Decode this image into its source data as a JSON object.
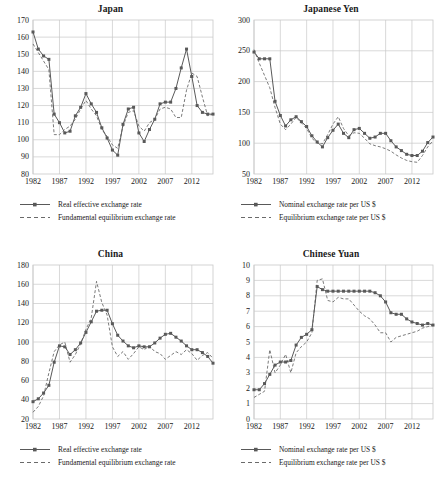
{
  "figure": {
    "background": "#ffffff",
    "series_color": "#595959",
    "grid_color": "#c9c9c9",
    "axis_color": "#808080",
    "text_color": "#1a1a1a"
  },
  "panels": [
    {
      "key": "japan",
      "title": "Japan",
      "legend": [
        {
          "label": "Real effective exchange rate",
          "style": "solid-marker"
        },
        {
          "label": "Fundamental equilibrium exchange rate",
          "style": "dashed"
        }
      ]
    },
    {
      "key": "japanese_yen",
      "title": "Japanese Yen",
      "legend": [
        {
          "label": "Nominal exchange rate per US $",
          "style": "solid-marker"
        },
        {
          "label": "Equilibrium exchange rate per US $",
          "style": "dashed"
        }
      ]
    },
    {
      "key": "china",
      "title": "China",
      "legend": [
        {
          "label": "Real effective exchange rate",
          "style": "solid-marker"
        },
        {
          "label": "Fundamental equilibrium exchange rate",
          "style": "dashed"
        }
      ]
    },
    {
      "key": "chinese_yuan",
      "title": "Chinese Yuan",
      "legend": [
        {
          "label": "Nominal exchange rate per US $",
          "style": "solid-marker"
        },
        {
          "label": "Equilibrium exchange rate per US $",
          "style": "dashed"
        }
      ]
    }
  ],
  "chart_data": [
    {
      "type": "line",
      "key": "japan",
      "title": "Japan",
      "xlabel": "",
      "ylabel": "",
      "xlim": [
        1982,
        2016
      ],
      "ylim": [
        80,
        170
      ],
      "yticks": [
        80,
        90,
        100,
        110,
        120,
        130,
        140,
        150,
        160,
        170
      ],
      "xticks": [
        1982,
        1987,
        1992,
        1997,
        2002,
        2007,
        2012
      ],
      "grid": true,
      "legend_position": "below",
      "x": [
        1982,
        1983,
        1984,
        1985,
        1986,
        1987,
        1988,
        1989,
        1990,
        1991,
        1992,
        1993,
        1994,
        1995,
        1996,
        1997,
        1998,
        1999,
        2000,
        2001,
        2002,
        2003,
        2004,
        2005,
        2006,
        2007,
        2008,
        2009,
        2010,
        2011,
        2012,
        2013,
        2014,
        2015,
        2016
      ],
      "series": [
        {
          "name": "Real effective exchange rate",
          "style": "solid-marker",
          "values": [
            163,
            153,
            149,
            147,
            115,
            110,
            104,
            105,
            114,
            119,
            127,
            121,
            116,
            107,
            101,
            94,
            91,
            109,
            118,
            119,
            104,
            99,
            106,
            112,
            121,
            122,
            122,
            130,
            142,
            153,
            137,
            120,
            116,
            115,
            115,
            143,
            153,
            160,
            148
          ]
        },
        {
          "name": "Fundamental equilibrium exchange rate",
          "style": "dashed",
          "values": [
            156,
            151,
            146,
            141,
            103,
            103,
            106,
            108,
            112,
            118,
            123,
            118,
            114,
            106,
            102,
            97,
            95,
            108,
            116,
            117,
            108,
            105,
            110,
            112,
            118,
            119,
            118,
            113,
            113,
            129,
            139,
            137,
            125,
            114,
            115,
            115,
            138,
            148,
            139
          ]
        }
      ]
    },
    {
      "type": "line",
      "key": "japanese_yen",
      "title": "Japanese Yen",
      "xlabel": "",
      "ylabel": "",
      "xlim": [
        1982,
        2016
      ],
      "ylim": [
        50,
        300
      ],
      "yticks": [
        50,
        100,
        150,
        200,
        250,
        300
      ],
      "xticks": [
        1982,
        1987,
        1992,
        1997,
        2002,
        2007,
        2012
      ],
      "grid": true,
      "legend_position": "below",
      "x": [
        1982,
        1983,
        1984,
        1985,
        1986,
        1987,
        1988,
        1989,
        1990,
        1991,
        1992,
        1993,
        1994,
        1995,
        1996,
        1997,
        1998,
        1999,
        2000,
        2001,
        2002,
        2003,
        2004,
        2005,
        2006,
        2007,
        2008,
        2009,
        2010,
        2011,
        2012,
        2013,
        2014,
        2015,
        2016
      ],
      "series": [
        {
          "name": "Nominal exchange rate per US $",
          "style": "solid-marker",
          "values": [
            248,
            237,
            237,
            237,
            168,
            145,
            128,
            138,
            143,
            135,
            127,
            112,
            102,
            94,
            109,
            121,
            131,
            116,
            109,
            122,
            124,
            116,
            108,
            110,
            116,
            116,
            104,
            94,
            88,
            82,
            80,
            80,
            87,
            101,
            110,
            119
          ]
        },
        {
          "name": "Equilibrium exchange rate per US $",
          "style": "dashed",
          "values": [
            252,
            230,
            210,
            190,
            158,
            131,
            122,
            131,
            142,
            133,
            124,
            108,
            100,
            99,
            114,
            131,
            143,
            124,
            112,
            117,
            116,
            108,
            99,
            96,
            94,
            91,
            87,
            81,
            76,
            72,
            70,
            69,
            80,
            94,
            104,
            112
          ]
        }
      ]
    },
    {
      "type": "line",
      "key": "china",
      "title": "China",
      "xlabel": "",
      "ylabel": "",
      "xlim": [
        1982,
        2016
      ],
      "ylim": [
        20,
        180
      ],
      "yticks": [
        20,
        40,
        60,
        80,
        100,
        120,
        140,
        160,
        180
      ],
      "xticks": [
        1982,
        1987,
        1992,
        1997,
        2002,
        2007,
        2012
      ],
      "grid": true,
      "legend_position": "below",
      "x": [
        1982,
        1983,
        1984,
        1985,
        1986,
        1987,
        1988,
        1989,
        1990,
        1991,
        1992,
        1993,
        1994,
        1995,
        1996,
        1997,
        1998,
        1999,
        2000,
        2001,
        2002,
        2003,
        2004,
        2005,
        2006,
        2007,
        2008,
        2009,
        2010,
        2011,
        2012,
        2013,
        2014,
        2015,
        2016
      ],
      "series": [
        {
          "name": "Real effective exchange rate",
          "style": "solid-marker",
          "values": [
            38,
            41,
            47,
            55,
            79,
            96,
            95,
            87,
            92,
            99,
            110,
            121,
            132,
            133,
            133,
            119,
            107,
            101,
            96,
            94,
            96,
            95,
            95,
            99,
            104,
            108,
            109,
            105,
            101,
            96,
            92,
            92,
            89,
            85,
            78,
            71,
            71
          ]
        },
        {
          "name": "Fundamental equilibrium exchange rate",
          "style": "dashed",
          "values": [
            27,
            33,
            44,
            68,
            90,
            97,
            100,
            79,
            87,
            98,
            113,
            125,
            163,
            141,
            128,
            95,
            85,
            90,
            82,
            88,
            95,
            92,
            96,
            90,
            88,
            82,
            86,
            90,
            87,
            92,
            88,
            81,
            86,
            89,
            83,
            76,
            71
          ]
        }
      ]
    },
    {
      "type": "line",
      "key": "chinese_yuan",
      "title": "Chinese Yuan",
      "xlabel": "",
      "ylabel": "",
      "xlim": [
        1982,
        2016
      ],
      "ylim": [
        0,
        10
      ],
      "yticks": [
        0,
        1,
        2,
        3,
        4,
        5,
        6,
        7,
        8,
        9,
        10
      ],
      "xticks": [
        1982,
        1987,
        1992,
        1997,
        2002,
        2007,
        2012
      ],
      "grid": true,
      "legend_position": "below",
      "x": [
        1982,
        1983,
        1984,
        1985,
        1986,
        1987,
        1988,
        1989,
        1990,
        1991,
        1992,
        1993,
        1994,
        1995,
        1996,
        1997,
        1998,
        1999,
        2000,
        2001,
        2002,
        2003,
        2004,
        2005,
        2006,
        2007,
        2008,
        2009,
        2010,
        2011,
        2012,
        2013,
        2014,
        2015,
        2016
      ],
      "series": [
        {
          "name": "Nominal exchange rate per US $",
          "style": "solid-marker",
          "values": [
            1.9,
            1.9,
            2.3,
            2.9,
            3.5,
            3.7,
            3.7,
            3.8,
            4.8,
            5.3,
            5.5,
            5.8,
            8.6,
            8.4,
            8.3,
            8.3,
            8.3,
            8.3,
            8.3,
            8.3,
            8.3,
            8.3,
            8.3,
            8.2,
            8.0,
            7.6,
            6.9,
            6.8,
            6.8,
            6.5,
            6.3,
            6.2,
            6.1,
            6.2,
            6.1
          ]
        },
        {
          "name": "Equilibrium exchange rate per US $",
          "style": "dashed",
          "values": [
            1.4,
            1.6,
            1.8,
            4.5,
            3.0,
            3.5,
            4.2,
            3.0,
            4.3,
            4.7,
            5.0,
            5.6,
            9.0,
            9.1,
            7.7,
            7.6,
            7.9,
            7.8,
            7.8,
            7.4,
            7.0,
            6.7,
            6.5,
            6.1,
            5.6,
            5.6,
            5.0,
            5.3,
            5.4,
            5.5,
            5.6,
            5.7,
            5.9,
            6.0,
            6.1
          ]
        }
      ]
    }
  ]
}
